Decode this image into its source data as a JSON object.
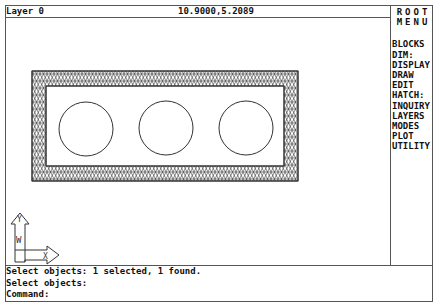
{
  "status_bar": {
    "layer": "Layer 0",
    "coordinates": "10.9000,5.2089"
  },
  "screen_menu": {
    "title_line1": "ROOT",
    "title_line2": "MENU",
    "items": [
      {
        "label": "BLOCKS"
      },
      {
        "label": "DIM:"
      },
      {
        "label": "DISPLAY"
      },
      {
        "label": "DRAW"
      },
      {
        "label": "EDIT"
      },
      {
        "label": "HATCH:"
      },
      {
        "label": "INQUIRY"
      },
      {
        "label": "LAYERS"
      },
      {
        "label": "MODES"
      },
      {
        "label": "PLOT"
      },
      {
        "label": "UTILITY"
      }
    ]
  },
  "command_area": {
    "lines": [
      "Select objects: 1 selected, 1 found.",
      "Select objects:",
      "Command:"
    ]
  },
  "ucs_icon": {
    "y_label": "Y",
    "w_label": "W",
    "x_label": "X"
  },
  "drawing": {
    "objects": [
      "hatched-rectangular-frame",
      "circle",
      "circle",
      "circle"
    ]
  }
}
